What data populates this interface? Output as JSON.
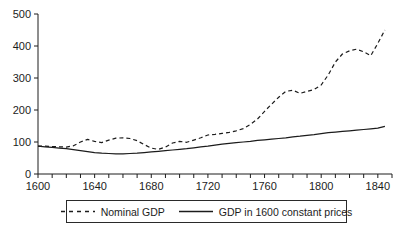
{
  "chart_data": {
    "type": "line",
    "title": "",
    "xlabel": "",
    "ylabel": "",
    "xlim": [
      1600,
      1850
    ],
    "ylim": [
      0,
      500
    ],
    "y_ticks": [
      0,
      100,
      200,
      300,
      400,
      500
    ],
    "x_ticks_labeled": [
      1600,
      1640,
      1680,
      1720,
      1760,
      1800,
      1840
    ],
    "x_minor_tick_step": 10,
    "grid": "off",
    "legend_position": "bottom-center-boxed",
    "line_color": "#1c1c1c",
    "x": [
      1600,
      1605,
      1610,
      1615,
      1620,
      1625,
      1630,
      1635,
      1640,
      1645,
      1650,
      1655,
      1660,
      1665,
      1670,
      1675,
      1680,
      1685,
      1690,
      1695,
      1700,
      1705,
      1710,
      1715,
      1720,
      1725,
      1730,
      1735,
      1740,
      1745,
      1750,
      1755,
      1760,
      1765,
      1770,
      1775,
      1780,
      1785,
      1790,
      1795,
      1800,
      1805,
      1810,
      1815,
      1820,
      1825,
      1830,
      1835,
      1840,
      1845
    ],
    "series": [
      {
        "name": "Nominal GDP",
        "style": "dashed",
        "values": [
          87,
          87,
          86,
          85,
          84,
          88,
          100,
          108,
          102,
          98,
          106,
          112,
          113,
          111,
          104,
          92,
          81,
          77,
          84,
          97,
          102,
          99,
          106,
          113,
          122,
          124,
          127,
          130,
          135,
          142,
          155,
          172,
          196,
          218,
          240,
          258,
          262,
          252,
          258,
          264,
          278,
          310,
          350,
          375,
          385,
          390,
          382,
          370,
          408,
          450
        ]
      },
      {
        "name": "GDP in 1600 constant prices",
        "style": "solid",
        "values": [
          87,
          85,
          83,
          81,
          79,
          76,
          73,
          70,
          67,
          65,
          64,
          63,
          63,
          64,
          65,
          67,
          69,
          71,
          73,
          75,
          77,
          79,
          82,
          85,
          87,
          90,
          93,
          96,
          98,
          100,
          102,
          105,
          107,
          109,
          111,
          113,
          116,
          118,
          121,
          123,
          126,
          129,
          131,
          133,
          135,
          137,
          139,
          141,
          143,
          149
        ]
      }
    ]
  }
}
